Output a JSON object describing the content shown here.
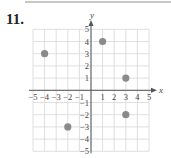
{
  "problem": {
    "number": "11."
  },
  "chart_data": {
    "type": "scatter",
    "title": "",
    "xlabel": "x",
    "ylabel": "y",
    "xlim": [
      -5,
      5
    ],
    "ylim": [
      -5,
      5
    ],
    "grid": true,
    "x_ticks": [
      -5,
      -4,
      -3,
      -2,
      -1,
      1,
      2,
      3,
      4,
      5
    ],
    "y_ticks": [
      -5,
      -4,
      -3,
      -2,
      -1,
      1,
      2,
      3,
      4,
      5
    ],
    "points": [
      {
        "x": -4,
        "y": 3
      },
      {
        "x": 1,
        "y": 4
      },
      {
        "x": 3,
        "y": 1
      },
      {
        "x": 3,
        "y": -2
      },
      {
        "x": -2,
        "y": -3
      }
    ],
    "point_color": "#8a8a8a",
    "grid_color": "#d8d8d8",
    "axis_color": "#555555"
  }
}
